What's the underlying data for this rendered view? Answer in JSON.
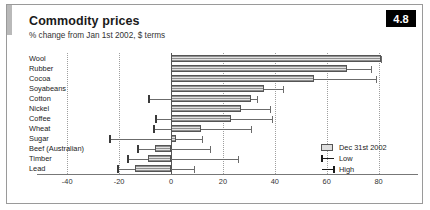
{
  "header": {
    "title": "Commodity prices",
    "subtitle": "% change from Jan 1st 2002, $ terms",
    "badge": "4.8"
  },
  "legend": {
    "bar_label": "Dec 31st 2002",
    "low_label": "Low",
    "high_label": "High"
  },
  "chart_data": {
    "type": "bar",
    "title": "Commodity prices",
    "subtitle": "% change from Jan 1st 2002, $ terms",
    "orientation": "horizontal",
    "xlabel": "",
    "ylabel": "",
    "xlim": [
      -40,
      80
    ],
    "xticks": [
      -40,
      -20,
      0,
      20,
      40,
      60,
      80
    ],
    "xtick_labels": [
      "-40",
      "-20",
      "0",
      "20",
      "40",
      "60",
      "80"
    ],
    "grid": true,
    "legend_position": "inside-right",
    "categories": [
      "Wool",
      "Rubber",
      "Cocoa",
      "Soyabeans",
      "Cotton",
      "Nickel",
      "Coffee",
      "Wheat",
      "Sugar",
      "Beef (Australian)",
      "Timber",
      "Lead"
    ],
    "series": [
      {
        "name": "Dec 31st 2002",
        "values": [
          81,
          68,
          55,
          36,
          31,
          27,
          23,
          11.5,
          2,
          -6,
          -9,
          -14
        ]
      },
      {
        "name": "Low",
        "values": [
          0,
          0,
          0,
          0,
          -9,
          0,
          -6,
          -7,
          -24,
          -13,
          -17,
          -21
        ]
      },
      {
        "name": "High",
        "values": [
          81,
          77,
          79,
          43,
          33,
          38,
          39,
          31,
          12,
          15,
          26,
          9
        ]
      }
    ]
  }
}
